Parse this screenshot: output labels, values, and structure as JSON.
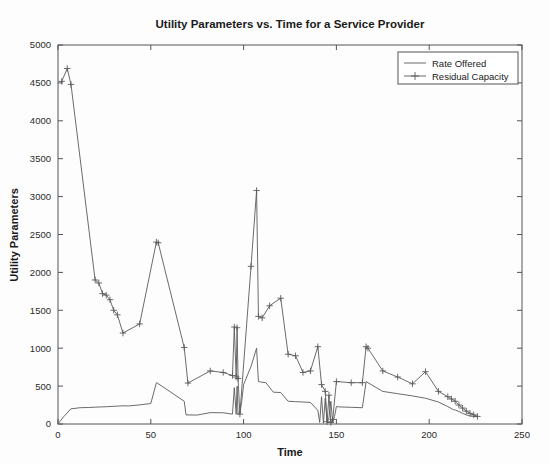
{
  "chart_data": {
    "type": "line",
    "title": "Utility Parameters vs. Time for a Service Provider",
    "xlabel": "Time",
    "ylabel": "Utility Parameters",
    "xlim": [
      0,
      250
    ],
    "ylim": [
      0,
      5000
    ],
    "xticks": [
      0,
      50,
      100,
      150,
      200,
      250
    ],
    "yticks": [
      0,
      500,
      1000,
      1500,
      2000,
      2500,
      3000,
      3500,
      4000,
      4500,
      5000
    ],
    "xtick_labels": [
      "0",
      "50",
      "100",
      "150",
      "200",
      "250"
    ],
    "ytick_labels": [
      "0",
      "500",
      "1000",
      "1500",
      "2000",
      "2500",
      "3000",
      "3500",
      "4000",
      "4500",
      "5000"
    ],
    "grid": false,
    "legend_position": "top-right",
    "line_color": "#5a5a5a",
    "series": [
      {
        "name": "Rate Offered",
        "marker": "none",
        "x": [
          0,
          3,
          7,
          12,
          17,
          20,
          23,
          26,
          29,
          32,
          35,
          38,
          44,
          50,
          53,
          53.5,
          62,
          68,
          69,
          75,
          82,
          89,
          94,
          95,
          96,
          96.5,
          97,
          98,
          99,
          100,
          104,
          107,
          108,
          109,
          112,
          116,
          120,
          124,
          128,
          132,
          136,
          140,
          141,
          142,
          143,
          144,
          145,
          146,
          147,
          148,
          149,
          150,
          152,
          158,
          164,
          166,
          167,
          175,
          183,
          191,
          198,
          205,
          210,
          213,
          214,
          216,
          218,
          220,
          222,
          224,
          226
        ],
        "y": [
          0,
          95,
          200,
          215,
          218,
          222,
          225,
          228,
          232,
          236,
          240,
          238,
          252,
          270,
          545,
          540,
          400,
          300,
          120,
          118,
          150,
          148,
          130,
          480,
          128,
          500,
          130,
          135,
          300,
          520,
          760,
          1000,
          560,
          555,
          545,
          420,
          415,
          300,
          295,
          290,
          285,
          180,
          20,
          360,
          10,
          340,
          15,
          80,
          300,
          20,
          100,
          230,
          225,
          220,
          215,
          560,
          545,
          430,
          400,
          370,
          340,
          290,
          230,
          190,
          185,
          165,
          140,
          120,
          105,
          100,
          95
        ]
      },
      {
        "name": "Residual Capacity",
        "marker": "plus",
        "x": [
          2,
          5,
          7,
          20,
          22,
          24,
          26,
          28,
          30,
          32,
          35,
          44,
          53,
          54,
          68,
          70,
          82,
          89,
          94,
          95,
          96,
          96.5,
          97,
          98,
          104,
          107,
          108,
          110,
          114,
          120,
          124,
          128,
          132,
          136,
          140,
          142,
          144,
          145,
          146,
          147,
          148,
          150,
          158,
          164,
          166,
          167,
          175,
          183,
          191,
          198,
          205,
          210,
          212,
          214,
          216,
          218,
          220,
          222,
          224,
          226
        ],
        "y": [
          4520,
          4690,
          4480,
          1900,
          1860,
          1720,
          1700,
          1640,
          1500,
          1440,
          1200,
          1320,
          2400,
          2390,
          1010,
          540,
          700,
          680,
          640,
          1280,
          620,
          1270,
          600,
          130,
          2080,
          3080,
          1420,
          1400,
          1560,
          1660,
          920,
          900,
          680,
          700,
          1020,
          520,
          430,
          30,
          380,
          20,
          60,
          560,
          545,
          545,
          1020,
          1000,
          700,
          620,
          530,
          690,
          430,
          360,
          330,
          300,
          250,
          210,
          170,
          140,
          120,
          100
        ]
      }
    ]
  },
  "legend": {
    "items": [
      {
        "label": "Rate Offered",
        "marker": "none"
      },
      {
        "label": "Residual Capacity",
        "marker": "plus"
      }
    ]
  }
}
